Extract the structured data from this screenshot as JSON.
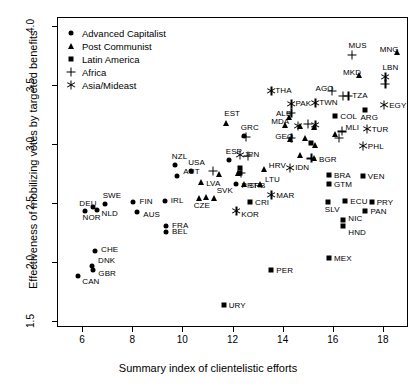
{
  "chart_data": {
    "type": "scatter",
    "title": "",
    "xlabel": "Summary index of clientelistic efforts",
    "ylabel": "Effectiveness of mobilizing votes by targeted benefits",
    "xlim": [
      5.0,
      19.0
    ],
    "ylim": [
      1.45,
      4.08
    ],
    "xticks": [
      6,
      8,
      10,
      12,
      14,
      16,
      18
    ],
    "yticks": [
      "4.0",
      "3.5",
      "3.0",
      "2.5",
      "2.0",
      "1.5"
    ],
    "ytick_values": [
      4.0,
      3.5,
      3.0,
      2.5,
      2.0,
      1.5
    ],
    "grid": false,
    "legend_position": "top-left",
    "legend": [
      {
        "label": "Advanced Capitalist",
        "marker": "circle"
      },
      {
        "label": "Post Communist",
        "marker": "triangle"
      },
      {
        "label": "Latin America",
        "marker": "square"
      },
      {
        "label": "Africa",
        "marker": "plus"
      },
      {
        "label": "Asia/Mideast",
        "marker": "star"
      }
    ],
    "series": [
      {
        "name": "Advanced Capitalist",
        "marker": "circle",
        "points": [
          {
            "label": "CAN",
            "x": 5.85,
            "y": 1.885,
            "lx": 4,
            "ly": 6
          },
          {
            "label": "GBR",
            "x": 6.45,
            "y": 1.935,
            "lx": 5,
            "ly": 4
          },
          {
            "label": "DNK",
            "x": 6.4,
            "y": 1.965,
            "lx": 6,
            "ly": -5
          },
          {
            "label": "CHE",
            "x": 6.52,
            "y": 2.095,
            "lx": 6,
            "ly": -1
          },
          {
            "label": "NOR",
            "x": 6.1,
            "y": 2.43,
            "lx": -2,
            "ly": 7
          },
          {
            "label": "NLD",
            "x": 6.58,
            "y": 2.445,
            "lx": 5,
            "ly": 4
          },
          {
            "label": "DEU",
            "x": 6.45,
            "y": 2.47,
            "lx": -14,
            "ly": -3
          },
          {
            "label": "SWE",
            "x": 6.9,
            "y": 2.49,
            "lx": -2,
            "ly": -8
          },
          {
            "label": "AUS",
            "x": 8.2,
            "y": 2.425,
            "lx": 6,
            "ly": 3
          },
          {
            "label": "FIN",
            "x": 8.05,
            "y": 2.51,
            "lx": 6,
            "ly": 0
          },
          {
            "label": "BEL",
            "x": 9.35,
            "y": 2.26,
            "lx": 6,
            "ly": 0
          },
          {
            "label": "FRA",
            "x": 9.35,
            "y": 2.31,
            "lx": 6,
            "ly": 0
          },
          {
            "label": "IRL",
            "x": 9.3,
            "y": 2.515,
            "lx": 6,
            "ly": 0
          },
          {
            "label": "AUT",
            "x": 9.8,
            "y": 2.735,
            "lx": 6,
            "ly": -4
          },
          {
            "label": "NZL",
            "x": 9.7,
            "y": 2.825,
            "lx": -3,
            "ly": -8
          },
          {
            "label": "USA",
            "x": 10.35,
            "y": 2.775,
            "lx": -3,
            "ly": -8
          },
          {
            "label": "PRT",
            "x": 12.12,
            "y": 2.665,
            "lx": 6,
            "ly": 2
          },
          {
            "label": "ESP",
            "x": 11.85,
            "y": 2.865,
            "lx": -3,
            "ly": -8
          },
          {
            "label": "GRC",
            "x": 12.45,
            "y": 3.07,
            "lx": -3,
            "ly": -8
          }
        ]
      },
      {
        "name": "Post Communist",
        "marker": "triangle",
        "points": [
          {
            "label": "CZE",
            "x": 10.65,
            "y": 2.545,
            "lx": -5,
            "ly": 8
          },
          {
            "label": "",
            "x": 10.95,
            "y": 2.555,
            "lx": 0,
            "ly": 0
          },
          {
            "label": "SVK",
            "x": 11.25,
            "y": 2.545,
            "lx": 3,
            "ly": -7
          },
          {
            "label": "LVA",
            "x": 10.75,
            "y": 2.68,
            "lx": 5,
            "ly": 2
          },
          {
            "label": "",
            "x": 11.45,
            "y": 2.745,
            "lx": 0,
            "ly": 0
          },
          {
            "label": "",
            "x": 12.22,
            "y": 2.755,
            "lx": 0,
            "ly": 0
          },
          {
            "label": "SRB",
            "x": 12.45,
            "y": 2.665,
            "lx": 5,
            "ly": 2
          },
          {
            "label": "LTU",
            "x": 13.1,
            "y": 2.66,
            "lx": 5,
            "ly": -4
          },
          {
            "label": "HRV",
            "x": 13.25,
            "y": 2.79,
            "lx": 5,
            "ly": -3
          },
          {
            "label": "EST",
            "x": 11.75,
            "y": 3.18,
            "lx": -2,
            "ly": -9
          },
          {
            "label": "ALB",
            "x": 14.25,
            "y": 3.23,
            "lx": -13,
            "ly": -3
          },
          {
            "label": "MDA",
            "x": 14.1,
            "y": 3.165,
            "lx": -14,
            "ly": -3
          },
          {
            "label": "GEO",
            "x": 14.3,
            "y": 3.045,
            "lx": -15,
            "ly": -2
          },
          {
            "label": "",
            "x": 14.7,
            "y": 3.155,
            "lx": 0,
            "ly": 0
          },
          {
            "label": "",
            "x": 14.88,
            "y": 3.055,
            "lx": 0,
            "ly": 0
          },
          {
            "label": "",
            "x": 14.7,
            "y": 2.91,
            "lx": 0,
            "ly": 0
          },
          {
            "label": "",
            "x": 15.25,
            "y": 3.15,
            "lx": 0,
            "ly": 0
          },
          {
            "label": "",
            "x": 15.3,
            "y": 2.995,
            "lx": 0,
            "ly": 0
          },
          {
            "label": "BGR",
            "x": 15.25,
            "y": 2.88,
            "lx": 5,
            "ly": 2
          },
          {
            "label": "",
            "x": 16.1,
            "y": 3.085,
            "lx": 0,
            "ly": 0
          },
          {
            "label": "MKD",
            "x": 17.05,
            "y": 3.585,
            "lx": -16,
            "ly": -2
          },
          {
            "label": "MNG",
            "x": 18.55,
            "y": 3.78,
            "lx": -17,
            "ly": -2
          }
        ]
      },
      {
        "name": "Latin America",
        "marker": "square",
        "points": [
          {
            "label": "URY",
            "x": 11.65,
            "y": 1.64,
            "lx": 5,
            "ly": 1
          },
          {
            "label": "PER",
            "x": 13.55,
            "y": 1.935,
            "lx": 5,
            "ly": 1
          },
          {
            "label": "MEX",
            "x": 15.85,
            "y": 2.035,
            "lx": 5,
            "ly": 1
          },
          {
            "label": "HND",
            "x": 16.42,
            "y": 2.31,
            "lx": 5,
            "ly": 7
          },
          {
            "label": "NIC",
            "x": 16.42,
            "y": 2.355,
            "lx": 5,
            "ly": -1
          },
          {
            "label": "PAN",
            "x": 17.3,
            "y": 2.43,
            "lx": 5,
            "ly": 1
          },
          {
            "label": "SLV",
            "x": 15.8,
            "y": 2.51,
            "lx": -3,
            "ly": 8
          },
          {
            "label": "ECU",
            "x": 16.5,
            "y": 2.515,
            "lx": 5,
            "ly": 1
          },
          {
            "label": "PRY",
            "x": 17.55,
            "y": 2.51,
            "lx": 5,
            "ly": 1
          },
          {
            "label": "CRI",
            "x": 12.7,
            "y": 2.51,
            "lx": 5,
            "ly": 1
          },
          {
            "label": "GTM",
            "x": 15.85,
            "y": 2.66,
            "lx": 5,
            "ly": 1
          },
          {
            "label": "BRA",
            "x": 15.85,
            "y": 2.74,
            "lx": 5,
            "ly": 1
          },
          {
            "label": "VEN",
            "x": 17.2,
            "y": 2.735,
            "lx": 5,
            "ly": 1
          },
          {
            "label": "",
            "x": 12.3,
            "y": 2.8,
            "lx": 0,
            "ly": 0
          },
          {
            "label": "",
            "x": 12.3,
            "y": 2.76,
            "lx": 0,
            "ly": 0
          },
          {
            "label": "",
            "x": 15.15,
            "y": 3.015,
            "lx": 0,
            "ly": 0
          },
          {
            "label": "COL",
            "x": 16.1,
            "y": 3.24,
            "lx": 5,
            "ly": 1
          },
          {
            "label": "ARG",
            "x": 17.3,
            "y": 3.29,
            "lx": -5,
            "ly": 8
          }
        ]
      },
      {
        "name": "Africa",
        "marker": "plus",
        "points": [
          {
            "label": "",
            "x": 11.22,
            "y": 2.775,
            "lx": 0,
            "ly": 0
          },
          {
            "label": "",
            "x": 12.6,
            "y": 2.9,
            "lx": 0,
            "ly": 0
          },
          {
            "label": "",
            "x": 12.35,
            "y": 2.755,
            "lx": 0,
            "ly": 0
          },
          {
            "label": "",
            "x": 12.55,
            "y": 3.06,
            "lx": 0,
            "ly": 0
          },
          {
            "label": "",
            "x": 14.35,
            "y": 3.055,
            "lx": 0,
            "ly": 0
          },
          {
            "label": "",
            "x": 14.35,
            "y": 3.265,
            "lx": 0,
            "ly": 0
          },
          {
            "label": "",
            "x": 15.0,
            "y": 3.17,
            "lx": 0,
            "ly": 0
          },
          {
            "label": "",
            "x": 15.15,
            "y": 2.88,
            "lx": 0,
            "ly": 0
          },
          {
            "label": "MLI",
            "x": 16.35,
            "y": 3.11,
            "lx": 4,
            "ly": -3
          },
          {
            "label": "",
            "x": 16.25,
            "y": 3.055,
            "lx": 0,
            "ly": 0
          },
          {
            "label": "AGO",
            "x": 15.95,
            "y": 3.45,
            "lx": -16,
            "ly": -2
          },
          {
            "label": "TZA",
            "x": 16.62,
            "y": 3.41,
            "lx": 4,
            "ly": 0
          },
          {
            "label": "",
            "x": 16.4,
            "y": 3.41,
            "lx": 0,
            "ly": 0
          },
          {
            "label": "MUS",
            "x": 16.75,
            "y": 3.755,
            "lx": -3,
            "ly": -9
          },
          {
            "label": "",
            "x": 18.1,
            "y": 3.51,
            "lx": 0,
            "ly": 0
          }
        ]
      },
      {
        "name": "Asia/Mideast",
        "marker": "star",
        "points": [
          {
            "label": "KOR",
            "x": 12.15,
            "y": 2.435,
            "lx": 5,
            "ly": 4
          },
          {
            "label": "MAR",
            "x": 13.55,
            "y": 2.57,
            "lx": 5,
            "ly": 1
          },
          {
            "label": "IDN",
            "x": 14.3,
            "y": 2.795,
            "lx": 5,
            "ly": 0
          },
          {
            "label": "JPN",
            "x": 12.3,
            "y": 2.905,
            "lx": 4,
            "ly": 0
          },
          {
            "label": "PHL",
            "x": 17.2,
            "y": 2.985,
            "lx": 5,
            "ly": 1
          },
          {
            "label": "",
            "x": 14.6,
            "y": 3.155,
            "lx": 0,
            "ly": 0
          },
          {
            "label": "",
            "x": 15.3,
            "y": 3.16,
            "lx": 0,
            "ly": 0
          },
          {
            "label": "TUR",
            "x": 17.35,
            "y": 3.13,
            "lx": 5,
            "ly": 1
          },
          {
            "label": "PAK",
            "x": 14.35,
            "y": 3.345,
            "lx": 4,
            "ly": 0
          },
          {
            "label": "TWN",
            "x": 15.3,
            "y": 3.35,
            "lx": 4,
            "ly": 0
          },
          {
            "label": "EGY",
            "x": 18.05,
            "y": 3.33,
            "lx": 5,
            "ly": 1
          },
          {
            "label": "THA",
            "x": 13.55,
            "y": 3.45,
            "lx": 4,
            "ly": 0
          },
          {
            "label": "LBN",
            "x": 18.1,
            "y": 3.575,
            "lx": -3,
            "ly": -9
          }
        ]
      }
    ]
  }
}
